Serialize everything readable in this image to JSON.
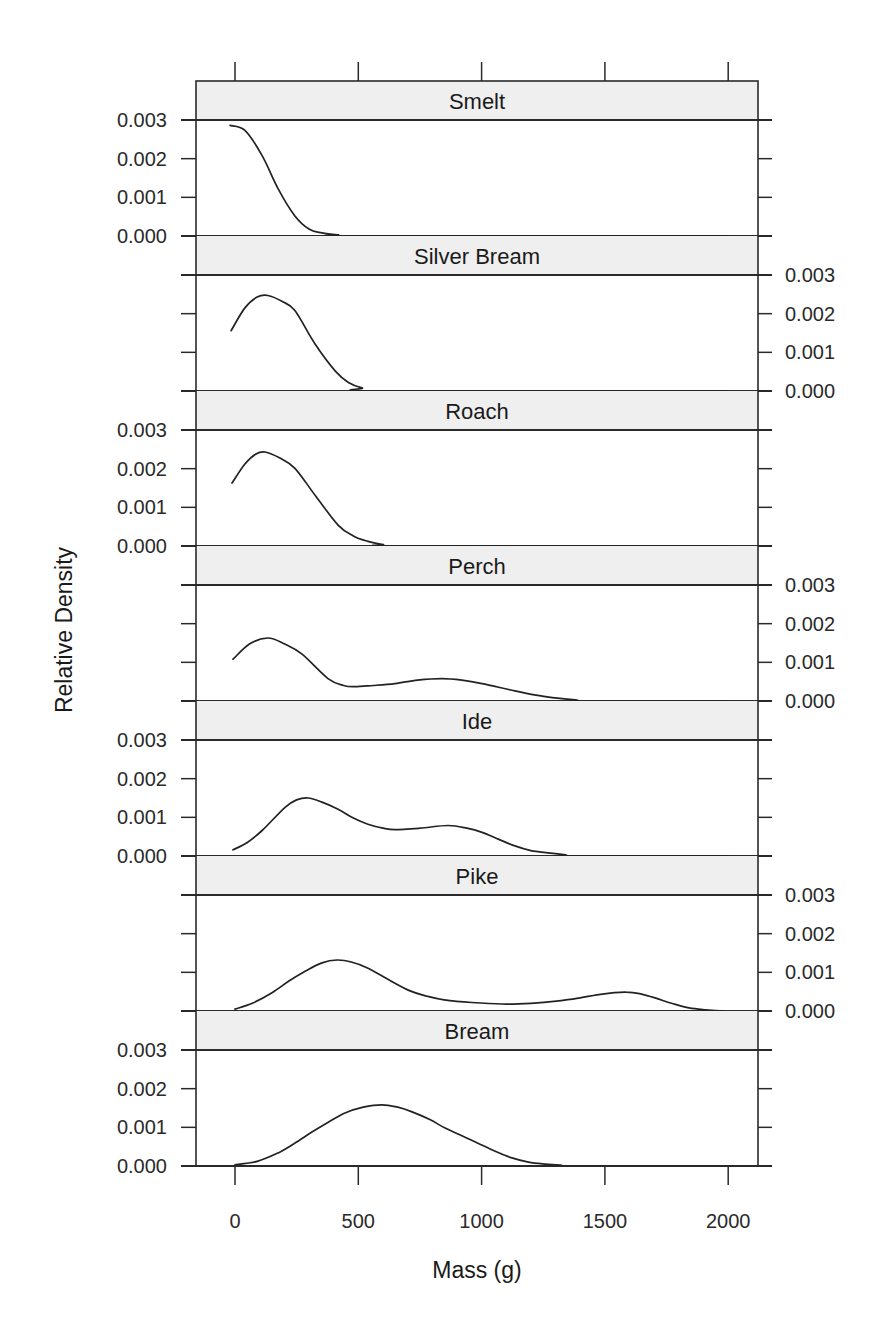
{
  "chart_data": {
    "type": "line",
    "subtype": "stacked-panel density plot (lattice)",
    "title": "",
    "xlabel": "Mass (g)",
    "ylabel": "Relative Density",
    "xlim": [
      -150,
      2150
    ],
    "ylim": [
      0,
      0.003
    ],
    "x_ticks": [
      0,
      500,
      1000,
      1500,
      2000
    ],
    "x_tick_labels": [
      "0",
      "500",
      "1000",
      "1500",
      "2000"
    ],
    "y_ticks": [
      0.0,
      0.001,
      0.002,
      0.003
    ],
    "y_tick_labels": [
      "0.000",
      "0.001",
      "0.002",
      "0.003"
    ],
    "grid": false,
    "legend": null,
    "series": [
      {
        "name": "Smelt",
        "y_axis_side": "left",
        "points": [
          [
            -20,
            0.00286
          ],
          [
            40,
            0.00273
          ],
          [
            110,
            0.00208
          ],
          [
            175,
            0.00122
          ],
          [
            243,
            0.00052
          ],
          [
            300,
            0.00018
          ],
          [
            353,
            8e-05
          ],
          [
            418,
            3e-05
          ],
          [
            500,
            0.0
          ],
          [
            2000,
            0.0
          ]
        ]
      },
      {
        "name": "Silver Bream",
        "y_axis_side": "right",
        "points": [
          [
            -16,
            0.00156
          ],
          [
            40,
            0.00215
          ],
          [
            90,
            0.00243
          ],
          [
            134,
            0.00247
          ],
          [
            190,
            0.00232
          ],
          [
            243,
            0.00208
          ],
          [
            324,
            0.00122
          ],
          [
            406,
            0.00052
          ],
          [
            460,
            0.00022
          ],
          [
            515,
            8e-05
          ],
          [
            596,
            0.0
          ],
          [
            2000,
            0.0
          ]
        ]
      },
      {
        "name": "Roach",
        "y_axis_side": "left",
        "points": [
          [
            -12,
            0.00163
          ],
          [
            40,
            0.00212
          ],
          [
            85,
            0.00238
          ],
          [
            122,
            0.00243
          ],
          [
            180,
            0.00228
          ],
          [
            243,
            0.00201
          ],
          [
            324,
            0.00132
          ],
          [
            418,
            0.00054
          ],
          [
            480,
            0.00026
          ],
          [
            539,
            0.00012
          ],
          [
            600,
            4e-05
          ],
          [
            677,
            0.0
          ],
          [
            2000,
            0.0
          ]
        ]
      },
      {
        "name": "Perch",
        "y_axis_side": "right",
        "points": [
          [
            -8,
            0.00108
          ],
          [
            60,
            0.00148
          ],
          [
            134,
            0.00163
          ],
          [
            200,
            0.00148
          ],
          [
            272,
            0.00121
          ],
          [
            377,
            0.00058
          ],
          [
            440,
            0.0004
          ],
          [
            487,
            0.00037
          ],
          [
            560,
            0.0004
          ],
          [
            649,
            0.00045
          ],
          [
            740,
            0.00054
          ],
          [
            839,
            0.00058
          ],
          [
            920,
            0.00054
          ],
          [
            1002,
            0.00045
          ],
          [
            1135,
            0.00026
          ],
          [
            1220,
            0.00015
          ],
          [
            1298,
            8e-05
          ],
          [
            1380,
            3e-05
          ],
          [
            1460,
            0.0
          ],
          [
            2000,
            0.0
          ]
        ]
      },
      {
        "name": "Ide",
        "y_axis_side": "left",
        "points": [
          [
            -8,
            0.00016
          ],
          [
            50,
            0.00035
          ],
          [
            110,
            0.00066
          ],
          [
            203,
            0.00126
          ],
          [
            250,
            0.00145
          ],
          [
            296,
            0.0015
          ],
          [
            350,
            0.0014
          ],
          [
            418,
            0.00121
          ],
          [
            480,
            0.00098
          ],
          [
            539,
            0.00082
          ],
          [
            600,
            0.00072
          ],
          [
            649,
            0.00068
          ],
          [
            750,
            0.00072
          ],
          [
            864,
            0.00079
          ],
          [
            940,
            0.00072
          ],
          [
            1002,
            0.00061
          ],
          [
            1070,
            0.00043
          ],
          [
            1135,
            0.00026
          ],
          [
            1200,
            0.00014
          ],
          [
            1269,
            8e-05
          ],
          [
            1340,
            3e-05
          ],
          [
            1407,
            0.0
          ],
          [
            2000,
            0.0
          ]
        ]
      },
      {
        "name": "Pike",
        "y_axis_side": "right",
        "points": [
          [
            0,
            5e-05
          ],
          [
            70,
            0.0002
          ],
          [
            150,
            0.00047
          ],
          [
            220,
            0.00078
          ],
          [
            288,
            0.00104
          ],
          [
            350,
            0.00124
          ],
          [
            414,
            0.00132
          ],
          [
            475,
            0.00126
          ],
          [
            535,
            0.00112
          ],
          [
            620,
            0.00082
          ],
          [
            710,
            0.00052
          ],
          [
            780,
            0.00038
          ],
          [
            848,
            0.00029
          ],
          [
            960,
            0.00022
          ],
          [
            1083,
            0.00018
          ],
          [
            1200,
            0.0002
          ],
          [
            1314,
            0.00026
          ],
          [
            1400,
            0.00034
          ],
          [
            1468,
            0.00042
          ],
          [
            1530,
            0.00047
          ],
          [
            1586,
            0.00049
          ],
          [
            1640,
            0.00045
          ],
          [
            1703,
            0.00034
          ],
          [
            1770,
            0.0002
          ],
          [
            1841,
            8e-05
          ],
          [
            1910,
            3e-05
          ],
          [
            1983,
            0.0
          ]
        ]
      },
      {
        "name": "Bream",
        "y_axis_side": "left",
        "points": [
          [
            0,
            3e-05
          ],
          [
            90,
            0.00012
          ],
          [
            175,
            0.00034
          ],
          [
            245,
            0.0006
          ],
          [
            312,
            0.00088
          ],
          [
            380,
            0.00114
          ],
          [
            446,
            0.00137
          ],
          [
            520,
            0.00152
          ],
          [
            596,
            0.00158
          ],
          [
            660,
            0.00152
          ],
          [
            718,
            0.0014
          ],
          [
            790,
            0.0012
          ],
          [
            852,
            0.00098
          ],
          [
            920,
            0.00078
          ],
          [
            985,
            0.00059
          ],
          [
            1055,
            0.00038
          ],
          [
            1123,
            0.00021
          ],
          [
            1190,
            0.0001
          ],
          [
            1257,
            5e-05
          ],
          [
            1320,
            2e-05
          ],
          [
            1391,
            0.0
          ],
          [
            2000,
            0.0
          ]
        ]
      }
    ]
  },
  "labels": {
    "xlabel": "Mass (g)",
    "ylabel": "Relative Density"
  },
  "colors": {
    "line": "#222222",
    "frame": "#2a2a2a",
    "strip_background": "#efefef",
    "background": "#ffffff"
  }
}
